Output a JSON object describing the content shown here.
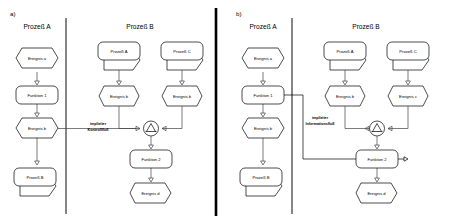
{
  "figure": {
    "background_color": "#ffffff",
    "line_color": "#444444",
    "stroke_color": "#000000"
  },
  "panels": [
    {
      "letter": "a)",
      "columns": [
        {
          "title": "Prozeß A"
        },
        {
          "title": "Prozeß B"
        }
      ],
      "annotation": {
        "line1": "impliziter",
        "line2": "Kontrollfluß"
      },
      "left_chain": [
        {
          "type": "event",
          "label": "Ereignis a"
        },
        {
          "type": "function",
          "label": "Funktion 1"
        },
        {
          "type": "event",
          "label": "Ereignis b"
        },
        {
          "type": "process",
          "label": "Prozeß B"
        }
      ],
      "right_branch_left": [
        {
          "type": "process",
          "label": "Prozeß A"
        },
        {
          "type": "event",
          "label": "Ereignis b"
        }
      ],
      "right_branch_right": [
        {
          "type": "process",
          "label": "Prozeß C"
        },
        {
          "type": "event",
          "label": "Ereignis b"
        }
      ],
      "connector": {
        "type": "xor-connector",
        "glyph": "XOR"
      },
      "right_tail": [
        {
          "type": "function",
          "label": "Funktion 2"
        },
        {
          "type": "event",
          "label": "Ereignis d"
        }
      ]
    },
    {
      "letter": "b)",
      "columns": [
        {
          "title": "Prozeß A"
        },
        {
          "title": "Prozeß B"
        }
      ],
      "annotation": {
        "line1": "impliziter",
        "line2": "Informationsfluß"
      },
      "left_chain": [
        {
          "type": "event",
          "label": "Ereignis a"
        },
        {
          "type": "function",
          "label": "Funktion 1"
        },
        {
          "type": "event",
          "label": "Ereignis b"
        },
        {
          "type": "process",
          "label": "Prozeß B"
        }
      ],
      "right_branch_left": [
        {
          "type": "process",
          "label": "Prozeß A"
        },
        {
          "type": "event",
          "label": "Ereignis b"
        }
      ],
      "right_branch_right": [
        {
          "type": "process",
          "label": "Prozeß C"
        },
        {
          "type": "event",
          "label": "Ereignis c"
        }
      ],
      "connector": {
        "type": "xor-connector",
        "glyph": "XOR"
      },
      "right_tail": [
        {
          "type": "function",
          "label": "Funktion 2"
        },
        {
          "type": "event",
          "label": "Ereignis d"
        }
      ]
    }
  ]
}
